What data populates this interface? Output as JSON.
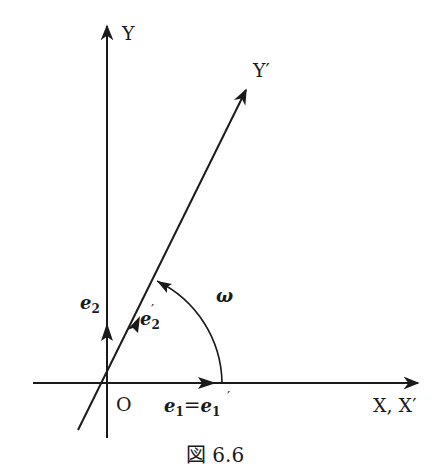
{
  "diagram": {
    "labels": {
      "y_axis": "Y",
      "y_prime_axis": "Y′",
      "x_axis": "X, X′",
      "origin": "O",
      "e2": "e",
      "e2_sub": "2",
      "e2_prime": "e",
      "e2_prime_sub": "2",
      "e2_prime_mark": "′",
      "e1_eq": "e",
      "e1_sub": "1",
      "equals": "=",
      "e1_prime": "e",
      "e1_prime_sub": "1",
      "e1_prime_mark": "′",
      "angle": "ω"
    },
    "caption": "図 6.6",
    "colors": {
      "ink": "#1a1a1a",
      "background": "#ffffff"
    }
  }
}
